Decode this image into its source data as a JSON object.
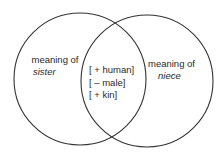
{
  "diagram": {
    "type": "venn",
    "left_set": {
      "label_line1": "meaning of",
      "label_line2": "sister"
    },
    "right_set": {
      "label_line1": "meaning of",
      "label_line2": "niece"
    },
    "intersection": {
      "features": [
        "[ + human]",
        "[ – male]",
        "[ + kin]"
      ]
    },
    "stroke_color": "#333333"
  }
}
